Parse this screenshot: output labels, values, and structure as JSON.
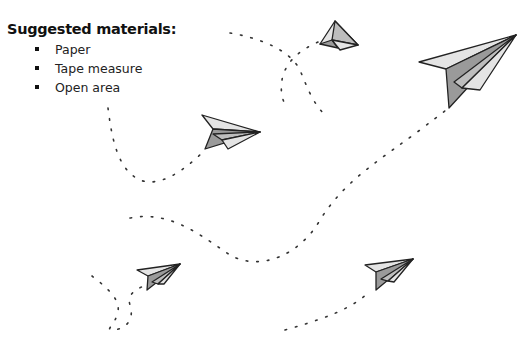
{
  "materials": {
    "heading": "Suggested materials:",
    "items": [
      {
        "label": "Paper"
      },
      {
        "label": "Tape measure"
      },
      {
        "label": "Open area"
      }
    ]
  },
  "illustration": {
    "planes": [
      {
        "name": "paper-plane-top-center",
        "icon": "paper-plane-icon"
      },
      {
        "name": "paper-plane-top-right-large",
        "icon": "paper-plane-icon"
      },
      {
        "name": "paper-plane-middle",
        "icon": "paper-plane-icon"
      },
      {
        "name": "paper-plane-bottom-left",
        "icon": "paper-plane-icon"
      },
      {
        "name": "paper-plane-bottom-right",
        "icon": "paper-plane-icon"
      }
    ],
    "colors": {
      "plane_light": "#e4e4e4",
      "plane_mid": "#bdbdbd",
      "plane_dark": "#9a9a9a",
      "outline": "#222222",
      "trail": "#333333"
    }
  }
}
